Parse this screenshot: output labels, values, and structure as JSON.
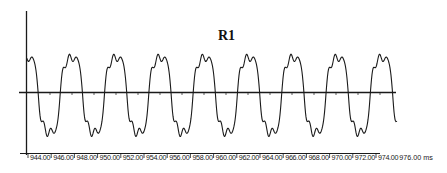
{
  "chart_data": {
    "type": "line",
    "title": "R1",
    "xlabel": "ms",
    "ylabel": "",
    "x_ticks": [
      "944.00",
      "946.00",
      "948.00",
      "950.00",
      "952.00",
      "954.00",
      "956.00",
      "958.00",
      "960.00",
      "962.00",
      "964.00",
      "966.00",
      "968.00",
      "970.00",
      "972.00",
      "974.00",
      "976.00 ms"
    ],
    "xlim": [
      943.5,
      976.0
    ],
    "grid": false,
    "legend": null,
    "series": [
      {
        "name": "R1",
        "description": "Periodic distorted sine-like waveform with harmonic ripple; ~8 cycles over 943.5–976 ms (period ≈ 3.8 ms), peaks flat-topped with notch, troughs sharp, small ripples near zero crossings",
        "period_ms": 3.8,
        "cycles": 8.5,
        "relative_peak": 1.0,
        "relative_trough": -1.1
      }
    ]
  },
  "chart": {
    "title": "R1",
    "x_ticks": [
      "944.00",
      "946.00",
      "948.00",
      "950.00",
      "952.00",
      "954.00",
      "956.00",
      "958.00",
      "960.00",
      "962.00",
      "964.00",
      "966.00",
      "968.00",
      "970.00",
      "972.00",
      "974.00"
    ],
    "x_unit_label": "976.00 ms",
    "colors": {
      "line": "#1a1a1a",
      "axis": "#1a1a1a",
      "background": "#ffffff"
    }
  }
}
